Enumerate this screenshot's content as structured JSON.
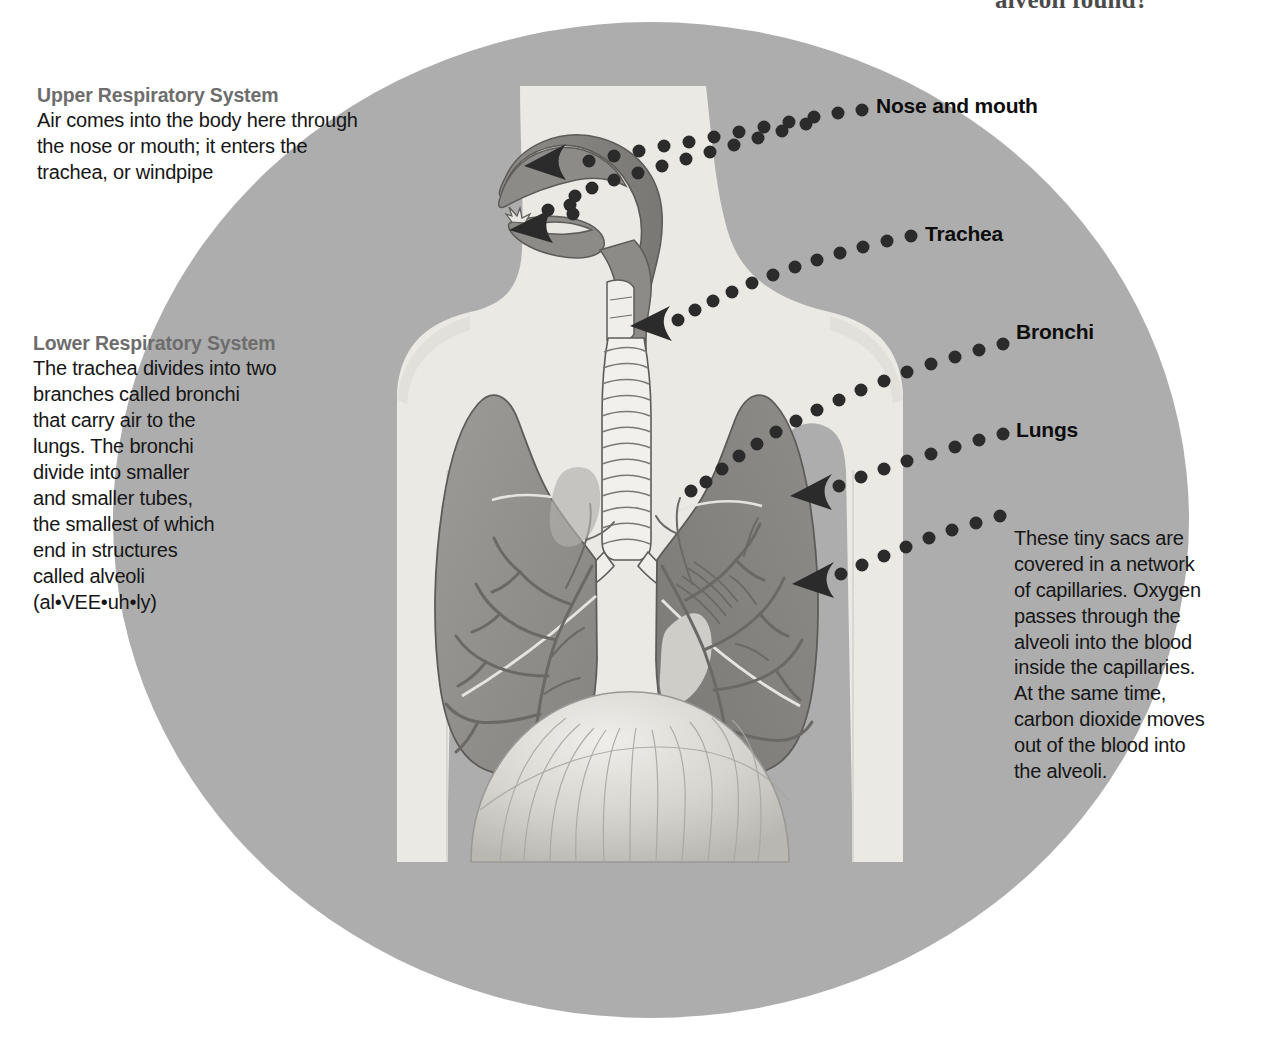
{
  "page": {
    "top_question_fragment": "alveoli found?",
    "background_color": "#ffffff",
    "circle_color": "#adadad",
    "body_color": "#ebe9e4",
    "organ_color": "#8c8c8c",
    "heading_color": "#6d6d6d",
    "body_text_color": "#161616"
  },
  "blocks": {
    "upper": {
      "heading": "Upper Respiratory System",
      "body": "Air comes into the body here through\nthe nose or mouth; it enters the\ntrachea, or windpipe"
    },
    "lower": {
      "heading": "Lower Respiratory System",
      "body": "The trachea divides into two\nbranches called bronchi\nthat carry air to the\nlungs. The bronchi\ndivide into smaller\nand smaller tubes,\nthe smallest of which\nend in structures\ncalled alveoli\n(al•VEE•uh•ly)"
    },
    "alveoli": {
      "heading": "Alveoli",
      "body": "These tiny sacs are\ncovered in a network\nof capillaries. Oxygen\npasses through the\nalveoli into the blood\ninside the capillaries.\nAt the same time,\ncarbon dioxide moves\nout of the blood into\nthe alveoli."
    }
  },
  "callouts": [
    {
      "id": "nose",
      "label": "Nose and mouth"
    },
    {
      "id": "trachea",
      "label": "Trachea"
    },
    {
      "id": "bronchi",
      "label": "Bronchi"
    },
    {
      "id": "lungs",
      "label": "Lungs"
    },
    {
      "id": "alveoli",
      "label": "Alveoli"
    }
  ]
}
